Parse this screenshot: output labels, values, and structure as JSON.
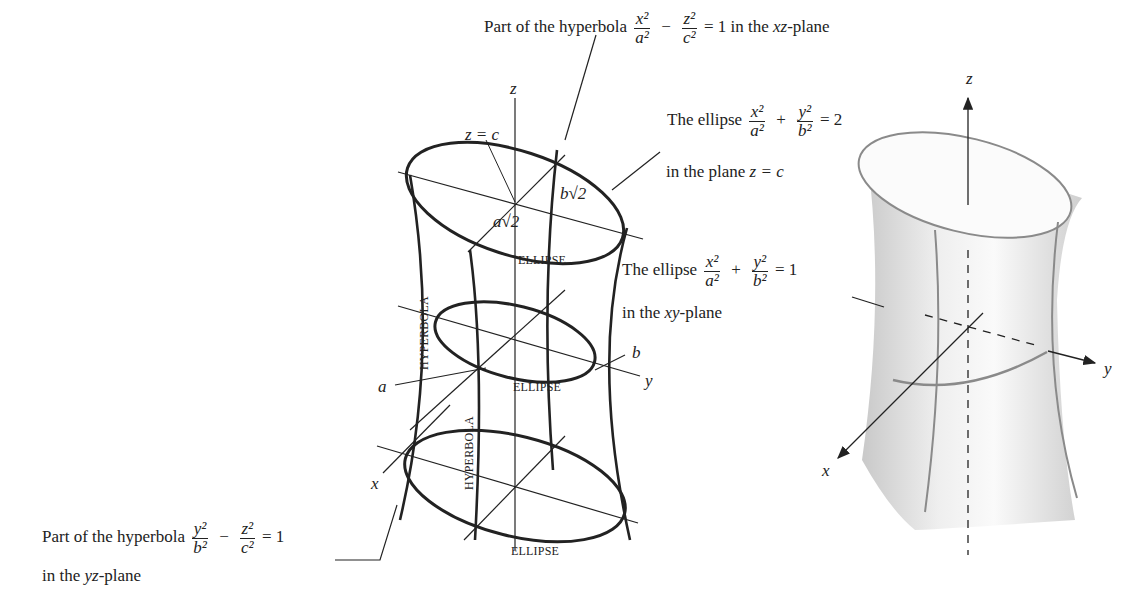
{
  "figure": {
    "annotations": {
      "hyperbola_xz": {
        "prefix": "Part of the hyperbola",
        "term1_num": "x²",
        "term1_den": "a²",
        "op": "−",
        "term2_num": "z²",
        "term2_den": "c²",
        "rhs": "= 1",
        "suffix_pre": "in the ",
        "plane": "xz",
        "suffix_post": "-plane"
      },
      "ellipse_top": {
        "prefix": "The ellipse",
        "term1_num": "x²",
        "term1_den": "a²",
        "op": "+",
        "term2_num": "y²",
        "term2_den": "b²",
        "rhs": "= 2",
        "line2_pre": "in the plane ",
        "line2_eq": "z = c"
      },
      "ellipse_xy": {
        "prefix": "The ellipse",
        "term1_num": "x²",
        "term1_den": "a²",
        "op": "+",
        "term2_num": "y²",
        "term2_den": "b²",
        "rhs": "= 1",
        "line2_pre": "in the ",
        "line2_plane": "xy",
        "line2_post": "-plane"
      },
      "hyperbola_yz": {
        "prefix": "Part of the hyperbola",
        "term1_num": "y²",
        "term1_den": "b²",
        "op": "−",
        "term2_num": "z²",
        "term2_den": "c²",
        "rhs": "= 1",
        "line2_pre": "in the ",
        "line2_plane": "yz",
        "line2_post": "-plane"
      }
    },
    "wireframe": {
      "z_axis": "z",
      "plane_label": "z = c",
      "b_root2": "b√2",
      "a_root2": "a√2",
      "ellipse_labels": [
        "ELLIPSE",
        "ELLIPSE",
        "ELLIPSE"
      ],
      "hyperbola_labels": [
        "HYPERBOLA",
        "HYPERBOLA"
      ],
      "a_label": "a",
      "b_label": "b",
      "x_axis": "x",
      "y_axis": "y"
    },
    "surface": {
      "z_axis": "z",
      "x_axis": "x",
      "y_axis": "y",
      "fill_color": "#e9e9e9",
      "curve_color": "#8a8a8a"
    }
  }
}
